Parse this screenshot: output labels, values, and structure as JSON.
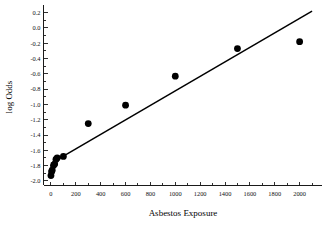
{
  "chart_data": {
    "type": "scatter",
    "title": "",
    "xlabel": "Asbestos Exposure",
    "ylabel": "log Odds",
    "xlim": [
      -60,
      2180
    ],
    "ylim": [
      -2.06,
      0.3
    ],
    "grid": false,
    "legend": "none",
    "xticks": [
      0,
      200,
      400,
      600,
      800,
      1000,
      1200,
      1400,
      1600,
      1800,
      2000
    ],
    "xticklabels": [
      "0",
      "200",
      "400",
      "600",
      "800",
      "1000",
      "1200",
      "1400",
      "1600",
      "1800",
      "2000"
    ],
    "yticks": [
      0.2,
      0.0,
      -0.2,
      -0.4,
      -0.6,
      -0.8,
      -1.0,
      -1.2,
      -1.4,
      -1.6,
      -1.8,
      -2.0
    ],
    "yticklabels": [
      "0.2",
      "0.0",
      "-0.2",
      "-0.4",
      "-0.6",
      "-0.8",
      "-1.0",
      "-1.2",
      "-1.4",
      "-1.6",
      "-1.8",
      "-2.0"
    ],
    "series": [
      {
        "name": "observed",
        "marker": "filled-circle",
        "color": "#000000",
        "x": [
          0,
          5,
          10,
          20,
          30,
          40,
          50,
          100,
          300,
          600,
          1000,
          1500,
          2000
        ],
        "y": [
          -1.93,
          -1.88,
          -1.86,
          -1.8,
          -1.78,
          -1.72,
          -1.7,
          -1.68,
          -1.25,
          -1.01,
          -0.63,
          -0.27,
          -0.18
        ]
      }
    ],
    "fit_line": {
      "name": "linear fit",
      "color": "#000000",
      "x": [
        0,
        2100
      ],
      "y": [
        -1.77,
        0.22
      ]
    }
  }
}
